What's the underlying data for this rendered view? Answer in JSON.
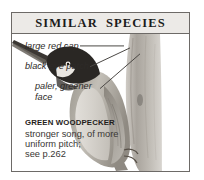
{
  "panel": {
    "title": "SIMILAR  SPECIES"
  },
  "annotations": [
    {
      "id": "large-red-cap",
      "text": "large red cap"
    },
    {
      "id": "black-eye-patch",
      "text": "black eye patch"
    },
    {
      "id": "paler-greener-face_line1",
      "text": "paler, greener"
    },
    {
      "id": "paler-greener-face_line2",
      "text": "face"
    }
  ],
  "caption": {
    "species": "GREEN WOODPECKER",
    "note_line1": "stronger song, of more",
    "note_line2": "uniform pitch;",
    "note_line3": "see p.262"
  },
  "illustration": {
    "subject": "green-woodpecker-on-tree-trunk",
    "description": "grayscale woodpecker clinging to a vertical tree trunk"
  },
  "colors": {
    "page_background": "#ffffff",
    "panel_border": "#6d6a67",
    "header_background": "#eceae7",
    "title_text": "#1b1b1b",
    "annotation_text": "#2d2a28",
    "caption_species_text": "#1f1d1b",
    "caption_note_text": "#3a3735",
    "leader_line": "#4a4744",
    "bird_body": "#b9b5ae",
    "bird_head_dark": "#2a2724",
    "trunk": "#b3afa9"
  }
}
